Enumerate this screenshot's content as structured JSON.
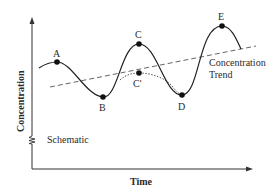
{
  "diagram": {
    "x_axis_label": "Time",
    "y_axis_label": "Concentration",
    "schematic_label": "Schematic",
    "trend_label_line1": "Concentration",
    "trend_label_line2": "Trend",
    "points": [
      {
        "id": "A",
        "label": "A"
      },
      {
        "id": "B",
        "label": "B"
      },
      {
        "id": "C",
        "label": "C"
      },
      {
        "id": "C_prime",
        "label": "C'"
      },
      {
        "id": "D",
        "label": "D"
      },
      {
        "id": "E",
        "label": "E"
      }
    ],
    "colors": {
      "line": "#222222",
      "trend": "#666666",
      "alt_path": "#555555",
      "text": "#2a2a2a"
    }
  }
}
